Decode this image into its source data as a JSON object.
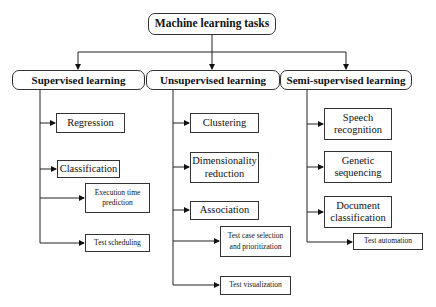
{
  "diagram": {
    "root": {
      "label": "Machine learning tasks"
    },
    "branches": [
      {
        "label": "Supervised learning",
        "children": [
          {
            "label": "Regression"
          },
          {
            "label": "Classification"
          },
          {
            "label": "Execution time",
            "label2": "prediction"
          },
          {
            "label": "Test scheduling"
          }
        ]
      },
      {
        "label": "Unsupervised learning",
        "children": [
          {
            "label": "Clustering"
          },
          {
            "label": "Dimensionality",
            "label2": "reduction"
          },
          {
            "label": "Association"
          },
          {
            "label": "Test case selection",
            "label2": "and prioritization"
          },
          {
            "label": "Test visualization"
          }
        ]
      },
      {
        "label": "Semi-supervised learning",
        "children": [
          {
            "label": "Speech",
            "label2": "recognition"
          },
          {
            "label": "Genetic",
            "label2": "sequencing"
          },
          {
            "label": "Document",
            "label2": "classification"
          },
          {
            "label": "Test automation"
          }
        ]
      }
    ]
  }
}
